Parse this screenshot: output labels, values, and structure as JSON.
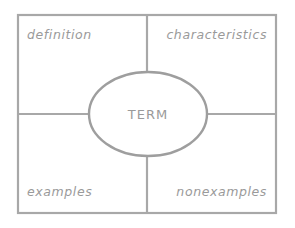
{
  "diagram": {
    "type": "frayer-model",
    "center_term": "TERM",
    "quadrants": {
      "top_left": "definition",
      "top_right": "characteristics",
      "bottom_left": "examples",
      "bottom_right": "nonexamples"
    },
    "colors": {
      "line": "#a8a8a8",
      "text": "#9a9a9a",
      "background": "#ffffff"
    }
  }
}
